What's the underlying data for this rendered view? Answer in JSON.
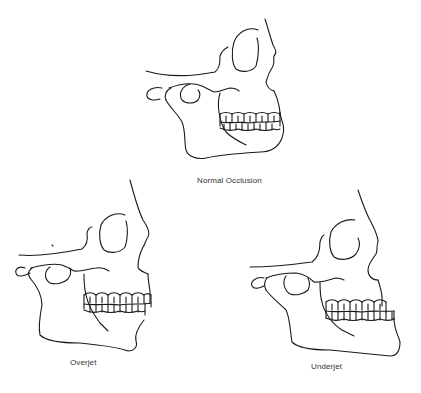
{
  "figures": [
    {
      "id": "normal",
      "caption": "Normal Occlusion"
    },
    {
      "id": "overjet",
      "caption": "Overjet"
    },
    {
      "id": "underjet",
      "caption": "Underjet"
    }
  ],
  "colors": {
    "line": "#1a1a1a",
    "text": "#333333",
    "background": "#ffffff"
  }
}
